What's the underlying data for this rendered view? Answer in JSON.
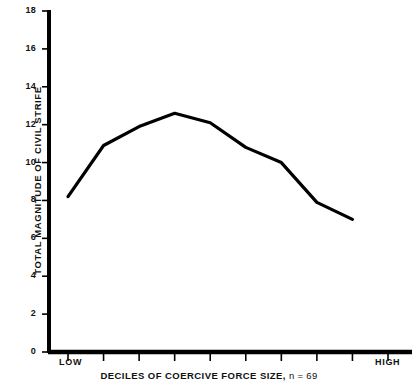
{
  "chart_data": {
    "type": "line",
    "title": "",
    "xlabel": "DECILES OF COERCIVE FORCE SIZE, n = 69",
    "xlabel_main": "DECILES OF COERCIVE FORCE SIZE,",
    "xlabel_n": "n = 69",
    "ylabel": "TOTAL MAGNITUDE OF CIVIL STRIFE",
    "ylim": [
      0,
      18
    ],
    "ytick_labels": [
      "18",
      "16",
      "14",
      "12",
      "10",
      "8",
      "6",
      "4",
      "2",
      "0"
    ],
    "ytick_values": [
      18,
      16,
      14,
      12,
      10,
      8,
      6,
      4,
      2,
      0
    ],
    "xlim": [
      1,
      10
    ],
    "x_axis_endpoint_labels": {
      "low": "LOW",
      "high": "HIGH"
    },
    "x_tick_count": 10,
    "categories": [
      1,
      2,
      3,
      4,
      5,
      6,
      7,
      8,
      9
    ],
    "values": [
      8.2,
      10.9,
      11.9,
      12.6,
      12.1,
      10.8,
      10.0,
      7.9,
      7.0
    ],
    "grid": false,
    "legend": null,
    "line_color": "#000000",
    "line_width": 3.2,
    "axis_color": "#000000",
    "background_color": "#ffffff"
  }
}
